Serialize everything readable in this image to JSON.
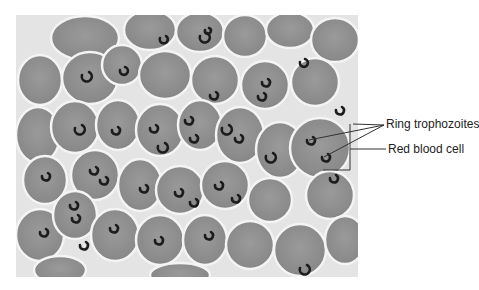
{
  "figure": {
    "photo": {
      "x": 16,
      "y": 15,
      "width": 342,
      "height": 262,
      "background": "#e6e6e6",
      "cell_color": "#8f8f8f",
      "cell_edge": "#f2f2f2",
      "parasite_color": "#1c1c1c"
    },
    "labels": [
      {
        "id": "ring-trophozoites",
        "text": "Ring trophozoites",
        "x": 386,
        "y": 117
      },
      {
        "id": "red-blood-cell",
        "text": "Red blood cell",
        "x": 388,
        "y": 142
      }
    ]
  }
}
